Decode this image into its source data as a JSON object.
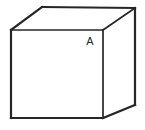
{
  "figure": {
    "type": "line-drawing",
    "canvas": {
      "width": 145,
      "height": 130
    },
    "background_color": "#ffffff",
    "stroke_color": "#262626",
    "fill_color": "#ffffff",
    "shape": {
      "name": "cube",
      "projection": "oblique-cabinet",
      "front_face": {
        "name": "front-face",
        "points": "11,30 103,30 103,118 11,118"
      },
      "top_face": {
        "name": "top-face",
        "points": "11,30 42,7 135,8 103,30"
      },
      "right_face": {
        "name": "right-face",
        "points": "103,30 135,8 135,105 103,118"
      },
      "edges": [
        {
          "name": "front-top-edge",
          "d": "M 11,30 L 103,30",
          "weight": "inner"
        },
        {
          "name": "front-left-edge",
          "d": "M 11,30 L 11,118",
          "weight": "outer"
        },
        {
          "name": "front-bottom-edge",
          "d": "M 11,118 L 103,118",
          "weight": "outer"
        },
        {
          "name": "front-right-edge",
          "d": "M 103,30 L 103,118",
          "weight": "inner"
        },
        {
          "name": "top-left-edge",
          "d": "M 11,30 L 42,7",
          "weight": "outer"
        },
        {
          "name": "top-back-edge",
          "d": "M 42,7 L 135,8",
          "weight": "outer"
        },
        {
          "name": "top-right-edge",
          "d": "M 103,30 L 135,8",
          "weight": "inner"
        },
        {
          "name": "right-back-edge",
          "d": "M 135,8 L 135,105",
          "weight": "outer"
        },
        {
          "name": "right-bottom-edge",
          "d": "M 103,118 L 135,105",
          "weight": "outer"
        }
      ]
    },
    "labels": [
      {
        "name": "vertex-label-a",
        "text": "A",
        "x": 90,
        "y": 45,
        "color": "#262626"
      }
    ]
  }
}
